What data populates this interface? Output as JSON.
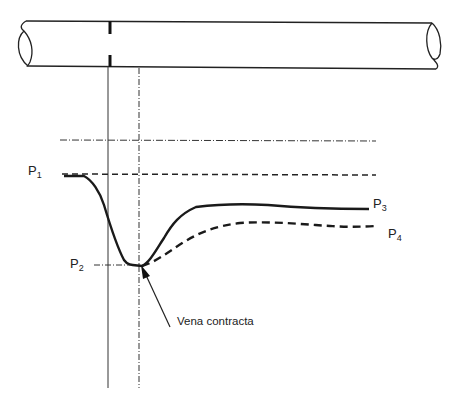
{
  "diagram": {
    "title": "",
    "labels": {
      "p1": {
        "base": "P",
        "sub": "1"
      },
      "p2": {
        "base": "P",
        "sub": "2"
      },
      "p3": {
        "base": "P",
        "sub": "3"
      },
      "p4": {
        "base": "P",
        "sub": "4"
      },
      "vena_contracta": "Vena contracta"
    },
    "colors": {
      "line": "#222222",
      "background": "#ffffff"
    }
  }
}
